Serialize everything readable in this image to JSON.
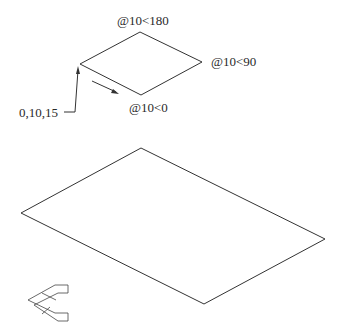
{
  "labels": {
    "top": "@10<180",
    "right": "@10<90",
    "bottom": "@10<0",
    "origin": "0,10,15"
  },
  "ucs_icon": {
    "x_label": "X",
    "y_label": "Y",
    "z_label": "Z"
  },
  "colors": {
    "line": "#333333",
    "background": "#ffffff"
  }
}
